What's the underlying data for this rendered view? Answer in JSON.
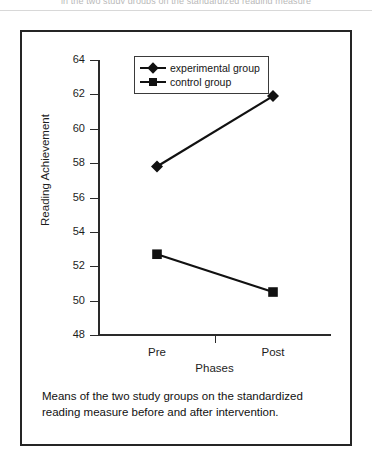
{
  "page": {
    "top_cut_text": "in the two study groups on the standardized reading measure"
  },
  "chart_data": {
    "type": "line",
    "title": "",
    "xlabel": "Phases",
    "ylabel": "Reading Achievement",
    "categories": [
      "Pre",
      "Post"
    ],
    "series": [
      {
        "name": "experimental group",
        "marker": "diamond",
        "values": [
          57.8,
          61.9
        ]
      },
      {
        "name": "control group",
        "marker": "square",
        "values": [
          52.7,
          50.5
        ]
      }
    ],
    "ylim": [
      48,
      64
    ],
    "yticks": [
      48,
      50,
      52,
      54,
      56,
      58,
      60,
      62,
      64
    ],
    "grid": false,
    "legend_position": "top-center",
    "line_color": "#111111"
  },
  "caption": {
    "text": "Means of the two study groups on the standardized reading measure before and after intervention."
  }
}
